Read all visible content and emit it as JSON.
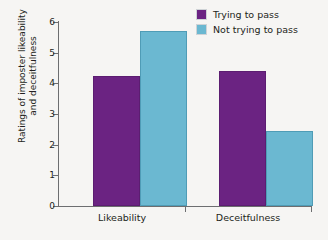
{
  "chart_data": {
    "type": "bar",
    "title": "",
    "xlabel": "",
    "ylabel": "Ratings of imposter likeability and deceitfulness",
    "ylabel_line1": "Ratings of imposter likeability",
    "ylabel_line2": "and deceitfulness",
    "categories": [
      "Likeability",
      "Deceitfulness"
    ],
    "series": [
      {
        "name": "Trying to pass",
        "color": "#6b2382",
        "values": [
          4.25,
          4.4
        ]
      },
      {
        "name": "Not trying to pass",
        "color": "#6bb8d1",
        "values": [
          5.7,
          2.45
        ]
      }
    ],
    "ylim": [
      0,
      6
    ],
    "ytick_labels": [
      "0",
      "1",
      "2",
      "3",
      "4",
      "5",
      "6"
    ],
    "ytick_values": [
      0,
      1,
      2,
      3,
      4,
      5,
      6
    ],
    "grid": false,
    "legend_position": "top-right"
  },
  "legend": {
    "items": [
      {
        "label": "Trying to pass",
        "swatch": "purple-swatch"
      },
      {
        "label": "Not trying to pass",
        "swatch": "blue-swatch"
      }
    ]
  },
  "colors": {
    "purple": "#6b2382",
    "blue": "#6bb8d1",
    "axis": "#6d6e70",
    "text": "#231f20",
    "background": "#f6f5f3"
  }
}
